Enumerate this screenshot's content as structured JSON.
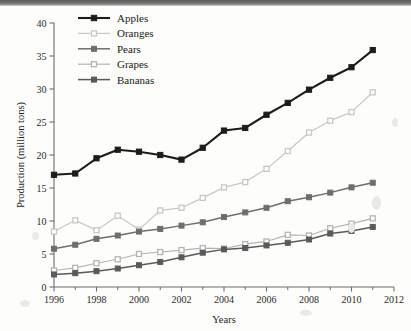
{
  "chart_data": {
    "type": "line",
    "title": "",
    "xlabel": "Years",
    "ylabel": "Production (million tons)",
    "xlim": [
      1996,
      2012
    ],
    "ylim": [
      0,
      40
    ],
    "grid": false,
    "legend_position": "top-left",
    "x": [
      1996,
      1997,
      1998,
      1999,
      2000,
      2001,
      2002,
      2003,
      2004,
      2005,
      2006,
      2007,
      2008,
      2009,
      2010,
      2011
    ],
    "xticks": [
      1996,
      1998,
      2000,
      2002,
      2004,
      2006,
      2008,
      2010,
      2012
    ],
    "xtick_labels": [
      "1996",
      "1998",
      "2000",
      "2002",
      "2004",
      "2006",
      "2008",
      "2010",
      "2012"
    ],
    "xminor_ticks": [
      1997,
      1999,
      2001,
      2003,
      2005,
      2007,
      2009,
      2011
    ],
    "yticks": [
      0,
      5,
      10,
      15,
      20,
      25,
      30,
      35,
      40
    ],
    "ytick_labels": [
      "0",
      "5",
      "10",
      "15",
      "20",
      "25",
      "30",
      "35",
      "40"
    ],
    "series": [
      {
        "name": "Apples",
        "color": "#1c1c1c",
        "marker": "filled-square",
        "line_width": 2.1,
        "values": [
          17.0,
          17.2,
          19.5,
          20.8,
          20.5,
          20.0,
          19.3,
          21.1,
          23.7,
          24.1,
          26.1,
          27.9,
          29.9,
          31.7,
          33.3,
          35.9
        ]
      },
      {
        "name": "Oranges",
        "color": "#c7c7c7",
        "marker": "open-square",
        "line_width": 1.2,
        "values": [
          8.4,
          10.1,
          8.6,
          10.8,
          8.7,
          11.6,
          12.0,
          13.5,
          15.1,
          15.9,
          17.9,
          20.6,
          23.4,
          25.2,
          26.5,
          29.5
        ]
      },
      {
        "name": "Pears",
        "color": "#6e6e6e",
        "marker": "filled-square",
        "line_width": 1.5,
        "values": [
          5.8,
          6.4,
          7.3,
          7.8,
          8.4,
          8.8,
          9.3,
          9.8,
          10.6,
          11.3,
          12.0,
          13.0,
          13.6,
          14.3,
          15.1,
          15.8
        ]
      },
      {
        "name": "Grapes",
        "color": "#b4b4b4",
        "marker": "open-square",
        "line_width": 1.2,
        "values": [
          2.5,
          2.9,
          3.6,
          4.2,
          5.0,
          5.3,
          5.6,
          5.9,
          5.8,
          6.5,
          6.9,
          7.9,
          7.8,
          8.9,
          9.6,
          10.4
        ]
      },
      {
        "name": "Bananas",
        "color": "#5a5a5a",
        "marker": "filled-square",
        "line_width": 1.5,
        "values": [
          1.9,
          2.1,
          2.4,
          2.8,
          3.3,
          3.8,
          4.5,
          5.2,
          5.7,
          5.9,
          6.3,
          6.7,
          7.2,
          8.1,
          8.5,
          9.1
        ]
      }
    ]
  },
  "axes": {
    "x_title": "Years",
    "y_title": "Production (million tons)"
  },
  "legend": {
    "entries": [
      {
        "label": "Apples"
      },
      {
        "label": "Oranges"
      },
      {
        "label": "Pears"
      },
      {
        "label": "Grapes"
      },
      {
        "label": "Bananas"
      }
    ]
  }
}
